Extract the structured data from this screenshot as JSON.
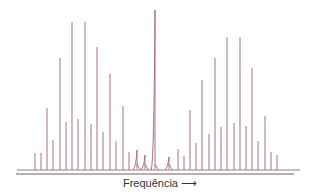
{
  "chart_data": {
    "type": "line",
    "title": "",
    "xlabel": "Frequência",
    "ylabel": "",
    "grid": false,
    "legend": null,
    "line_color": "#a8737d",
    "axis_color": "#666666",
    "baseline_y": 170,
    "axis_y": 174,
    "baseline_x_range": [
      17,
      300
    ],
    "axis_x_range": [
      16,
      294
    ],
    "peaks": [
      {
        "x": 35,
        "top": 153
      },
      {
        "x": 41,
        "top": 153
      },
      {
        "x": 47,
        "top": 108
      },
      {
        "x": 53,
        "top": 140
      },
      {
        "x": 60,
        "top": 58
      },
      {
        "x": 66,
        "top": 122
      },
      {
        "x": 72,
        "top": 22
      },
      {
        "x": 78,
        "top": 119
      },
      {
        "x": 85,
        "top": 22
      },
      {
        "x": 91,
        "top": 124
      },
      {
        "x": 97,
        "top": 47
      },
      {
        "x": 103,
        "top": 132
      },
      {
        "x": 110,
        "top": 74
      },
      {
        "x": 116,
        "top": 141
      },
      {
        "x": 123,
        "top": 106
      },
      {
        "x": 129,
        "top": 152
      },
      {
        "x": 137,
        "top": 150,
        "broad": true
      },
      {
        "x": 145,
        "top": 155,
        "broad": true
      },
      {
        "x": 155,
        "top": 10,
        "broad": true
      },
      {
        "x": 169,
        "top": 157,
        "broad": true
      },
      {
        "x": 178,
        "top": 149
      },
      {
        "x": 184,
        "top": 156
      },
      {
        "x": 190,
        "top": 110
      },
      {
        "x": 196,
        "top": 143
      },
      {
        "x": 202,
        "top": 80
      },
      {
        "x": 209,
        "top": 134
      },
      {
        "x": 215,
        "top": 58
      },
      {
        "x": 221,
        "top": 127
      },
      {
        "x": 227,
        "top": 37
      },
      {
        "x": 234,
        "top": 123
      },
      {
        "x": 240,
        "top": 37
      },
      {
        "x": 246,
        "top": 126
      },
      {
        "x": 252,
        "top": 68
      },
      {
        "x": 258,
        "top": 141
      },
      {
        "x": 265,
        "top": 116
      },
      {
        "x": 271,
        "top": 152
      },
      {
        "x": 277,
        "top": 155
      }
    ]
  },
  "labels": {
    "xlabel": "Frequência",
    "arrow": "⟶"
  }
}
